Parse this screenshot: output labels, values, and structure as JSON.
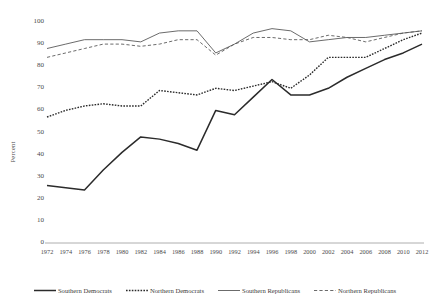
{
  "chart_data": {
    "type": "line",
    "title": "",
    "xlabel": "",
    "ylabel": "Percent",
    "ylim": [
      0,
      100
    ],
    "ytick_step": 10,
    "grid": false,
    "legend_position": "bottom",
    "x": [
      1972,
      1974,
      1976,
      1978,
      1980,
      1982,
      1984,
      1986,
      1988,
      1990,
      1992,
      1994,
      1996,
      1998,
      2000,
      2002,
      2004,
      2006,
      2008,
      2010,
      2012
    ],
    "yticks": [
      0,
      10,
      20,
      30,
      40,
      50,
      60,
      70,
      80,
      90,
      100
    ],
    "xticks": [
      "1972",
      "1974",
      "1976",
      "1978",
      "1980",
      "1982",
      "1984",
      "1986",
      "1988",
      "1990",
      "1992",
      "1994",
      "1996",
      "1998",
      "2000",
      "2002",
      "2004",
      "2006",
      "2008",
      "2010",
      "2012"
    ],
    "series": [
      {
        "name": "Southern Democrats",
        "style": "solid-thick",
        "color": "#2b2b2b",
        "values": [
          26,
          25,
          24,
          33,
          41,
          48,
          47,
          45,
          42,
          60,
          58,
          66,
          74,
          67,
          67,
          70,
          75,
          79,
          83,
          86,
          90
        ]
      },
      {
        "name": "Northern Democrats",
        "style": "dotted",
        "color": "#2b2b2b",
        "values": [
          57,
          60,
          62,
          63,
          62,
          62,
          69,
          68,
          67,
          70,
          69,
          71,
          73,
          70,
          76,
          84,
          84,
          84,
          88,
          92,
          95
        ]
      },
      {
        "name": "Southern Republicans",
        "style": "solid-thin",
        "color": "#5a5a5a",
        "values": [
          88,
          90,
          92,
          92,
          92,
          91,
          95,
          96,
          96,
          86,
          90,
          95,
          97,
          96,
          91,
          92,
          93,
          93,
          94,
          95,
          96
        ]
      },
      {
        "name": "Northern Republicans",
        "style": "dashed",
        "color": "#5a5a5a",
        "values": [
          84,
          86,
          88,
          90,
          90,
          89,
          90,
          92,
          92,
          85,
          90,
          93,
          93,
          92,
          92,
          94,
          93,
          91,
          93,
          95,
          96
        ]
      }
    ]
  },
  "legend": {
    "items": [
      {
        "label": "Southern Democrats"
      },
      {
        "label": "Northern Democrats"
      },
      {
        "label": "Southern Republicans"
      },
      {
        "label": "Northern Republicans"
      }
    ]
  }
}
